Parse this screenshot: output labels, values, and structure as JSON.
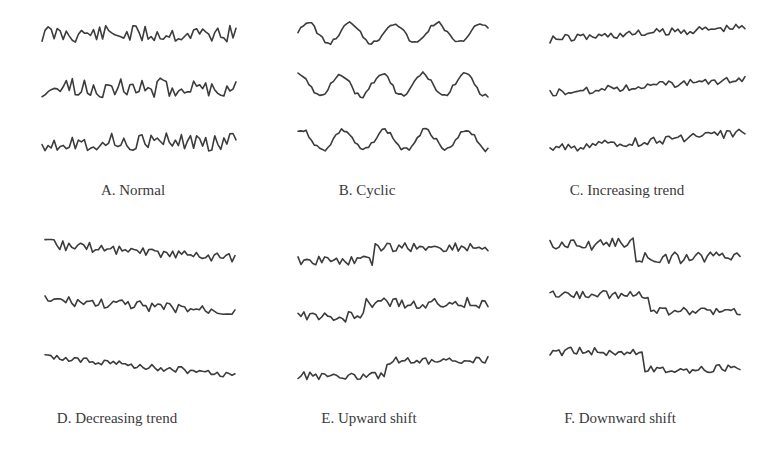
{
  "figure": {
    "background": "#ffffff",
    "line_color": "#3c3c3c",
    "label_color": "#3a3a3a"
  },
  "panels": [
    {
      "id": "A",
      "label": "A. Normal",
      "pattern": "normal",
      "x0": 42,
      "x1": 236,
      "label_x": 133,
      "label_y": 182,
      "traces": [
        {
          "center_y": 34,
          "amp": 9,
          "kind": "noise",
          "seed": 11
        },
        {
          "center_y": 88,
          "amp": 10,
          "kind": "noise",
          "seed": 23
        },
        {
          "center_y": 142,
          "amp": 9,
          "kind": "noise",
          "seed": 37
        }
      ]
    },
    {
      "id": "B",
      "label": "B. Cyclic",
      "pattern": "cyclic",
      "x0": 298,
      "x1": 488,
      "label_x": 367,
      "label_y": 182,
      "traces": [
        {
          "center_y": 33,
          "amp": 10,
          "kind": "cyclic",
          "seed": 5,
          "periods": 4.4,
          "phase": 0.2
        },
        {
          "center_y": 85,
          "amp": 11,
          "kind": "cyclic",
          "seed": 9,
          "periods": 4.6,
          "phase": 1.4
        },
        {
          "center_y": 140,
          "amp": 10,
          "kind": "cyclic",
          "seed": 14,
          "periods": 4.6,
          "phase": 1.0
        }
      ]
    },
    {
      "id": "C",
      "label": "C. Increasing trend",
      "pattern": "increasing_trend",
      "x0": 550,
      "x1": 745,
      "label_x": 627,
      "label_y": 182,
      "traces": [
        {
          "center_y": 33,
          "amp": 4,
          "kind": "trend",
          "seed": 41,
          "slope": -12
        },
        {
          "center_y": 86,
          "amp": 3.5,
          "kind": "trend",
          "seed": 52,
          "slope": -14
        },
        {
          "center_y": 141,
          "amp": 4.5,
          "kind": "trend",
          "seed": 63,
          "slope": -16
        }
      ]
    },
    {
      "id": "D",
      "label": "D. Decreasing trend",
      "pattern": "decreasing_trend",
      "x0": 45,
      "x1": 235,
      "label_x": 117,
      "label_y": 410,
      "traces": [
        {
          "center_y": 251,
          "amp": 5,
          "kind": "trend",
          "seed": 71,
          "slope": 14
        },
        {
          "center_y": 306,
          "amp": 5,
          "kind": "trend",
          "seed": 83,
          "slope": 12
        },
        {
          "center_y": 366,
          "amp": 3,
          "kind": "trend",
          "seed": 95,
          "slope": 18
        }
      ]
    },
    {
      "id": "E",
      "label": "E. Upward shift",
      "pattern": "upward_shift",
      "x0": 298,
      "x1": 488,
      "label_x": 369,
      "label_y": 410,
      "traces": [
        {
          "center_y": 254,
          "amp": 5,
          "kind": "shift",
          "seed": 101,
          "shift_at": 0.4,
          "shift": -13
        },
        {
          "center_y": 310,
          "amp": 5.5,
          "kind": "shift",
          "seed": 113,
          "shift_at": 0.35,
          "shift": -14
        },
        {
          "center_y": 368,
          "amp": 4,
          "kind": "shift",
          "seed": 127,
          "shift_at": 0.46,
          "shift": -15
        }
      ]
    },
    {
      "id": "F",
      "label": "F. Downward shift",
      "pattern": "downward_shift",
      "x0": 550,
      "x1": 740,
      "label_x": 620,
      "label_y": 410,
      "traces": [
        {
          "center_y": 251,
          "amp": 6,
          "kind": "shift",
          "seed": 131,
          "shift_at": 0.44,
          "shift": 14
        },
        {
          "center_y": 303,
          "amp": 4,
          "kind": "shift",
          "seed": 149,
          "shift_at": 0.52,
          "shift": 17
        },
        {
          "center_y": 360,
          "amp": 4.5,
          "kind": "shift",
          "seed": 157,
          "shift_at": 0.5,
          "shift": 18
        }
      ]
    }
  ]
}
